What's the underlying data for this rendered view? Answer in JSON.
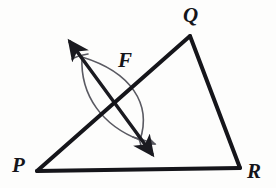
{
  "figure": {
    "kind": "geometry-construction",
    "background_color": "#fdfdfc",
    "triangle_stroke_color": "#15151a",
    "triangle_stroke_width": 4,
    "construction_stroke_color": "#5a5a62",
    "construction_stroke_width": 1.6,
    "bisector_stroke_color": "#1a1a20",
    "bisector_stroke_width": 3.4,
    "vertices": [
      {
        "name": "P",
        "label": "P",
        "x": 37,
        "y": 171
      },
      {
        "name": "Q",
        "label": "Q",
        "x": 190,
        "y": 36
      },
      {
        "name": "R",
        "label": "R",
        "x": 240,
        "y": 168
      }
    ],
    "sides": [
      {
        "name": "PQ",
        "from": "P",
        "to": "Q"
      },
      {
        "name": "QR",
        "from": "Q",
        "to": "R"
      },
      {
        "name": "PR",
        "from": "P",
        "to": "R"
      }
    ],
    "intersection_point": {
      "name": "F",
      "label": "F",
      "x": 111,
      "y": 98,
      "on_side": "PQ"
    },
    "arc_intersections": [
      {
        "name": "upper",
        "x": 82,
        "y": 57
      },
      {
        "name": "lower",
        "x": 140,
        "y": 140
      }
    ],
    "arcs": [
      {
        "name": "arc-from-P",
        "description": "compass arc centered at P bulging toward Q",
        "start_x": 82,
        "start_y": 57,
        "c1_x": 131,
        "c1_y": 72,
        "c2_x": 152,
        "c2_y": 104,
        "end_x": 140,
        "end_y": 140
      },
      {
        "name": "arc-from-Q",
        "description": "compass arc centered at Q bulging toward P",
        "start_x": 82,
        "start_y": 57,
        "c1_x": 80,
        "c1_y": 96,
        "c2_x": 103,
        "c2_y": 126,
        "end_x": 140,
        "end_y": 140
      }
    ],
    "bisector_line": {
      "name": "perpendicular-bisector",
      "x1": 70,
      "y1": 42,
      "x2": 152,
      "y2": 154,
      "arrowhead_start": true,
      "arrowhead_end": true
    },
    "labels": {
      "P": "P",
      "Q": "Q",
      "R": "R",
      "F": "F"
    }
  }
}
